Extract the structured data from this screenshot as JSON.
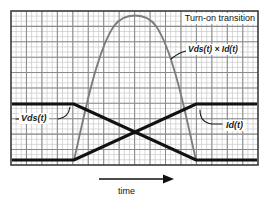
{
  "figure": {
    "title": "Turn-on transition",
    "axis_label_x": "time",
    "labels": {
      "vds": "Vds(t)",
      "id": "Id(t)",
      "power": "Vds(t) × Id(t)"
    },
    "colors": {
      "waveform": "#111111",
      "power_curve": "#7d7d7d",
      "grid_minor": "#c8c8c8",
      "grid_major": "#8a8a8a",
      "border": "#333333",
      "background": "#ffffff",
      "text": "#111111"
    }
  },
  "chart_data": {
    "type": "line",
    "title": "Turn-on transition",
    "xlabel": "time",
    "ylabel": "",
    "xlim": [
      0,
      100
    ],
    "ylim": [
      0,
      100
    ],
    "grid": true,
    "legend": "inline-annotations",
    "axis_ticks_labeled": false,
    "annotations": [
      {
        "text": "Turn-on transition",
        "x": 78,
        "y": 96
      },
      {
        "text": "Vds(t)",
        "x": 7,
        "y": 42
      },
      {
        "text": "Id(t)",
        "x": 88,
        "y": 37
      },
      {
        "text": "Vds(t) × Id(t)",
        "x": 72,
        "y": 77
      },
      {
        "text": "time",
        "x": 45,
        "y": -12
      }
    ],
    "series": [
      {
        "name": "Vds(t)",
        "style": "solid-thick-black",
        "description": "Drain-source voltage: high before turn-on, ramps linearly down to zero during the transition, stays at zero after.",
        "x": [
          0,
          25.5,
          75,
          100
        ],
        "y": [
          66,
          66,
          2,
          2
        ]
      },
      {
        "name": "Id(t)",
        "style": "solid-thick-black",
        "description": "Drain current: zero before turn-on, ramps linearly up to full value during the transition, stays high after.",
        "x": [
          0,
          25.5,
          75,
          100
        ],
        "y": [
          2,
          2,
          66,
          66
        ]
      },
      {
        "name": "Vds(t) × Id(t)",
        "style": "solid-gray-parabola",
        "description": "Instantaneous power dissipation, the product of the falling voltage and rising current, forming a parabolic pulse peaking mid-transition.",
        "x": [
          25.5,
          31,
          37,
          43,
          50,
          56,
          62,
          68,
          75
        ],
        "y": [
          2,
          42,
          70,
          88,
          95,
          88,
          70,
          42,
          2
        ]
      }
    ]
  }
}
